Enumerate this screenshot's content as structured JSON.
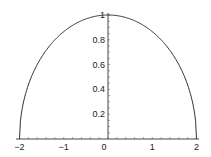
{
  "chart_data": {
    "type": "line",
    "title": "",
    "xlabel": "",
    "ylabel": "",
    "xlim": [
      -2,
      2
    ],
    "ylim": [
      0,
      1
    ],
    "x_ticks": [
      -2,
      -1,
      0,
      1,
      2
    ],
    "x_tick_labels": [
      "−2",
      "−1",
      "0",
      "1",
      "2"
    ],
    "y_ticks": [
      0.2,
      0.4,
      0.6,
      0.8,
      1
    ],
    "y_tick_labels": [
      "0.2",
      "0.4",
      "0.6",
      "0.8",
      "1"
    ],
    "grid": false,
    "legend": null,
    "series": [
      {
        "name": "y = sqrt(1 - x^2/4)",
        "color": "#333333",
        "x": [
          -2,
          -1.9,
          -1.75,
          -1.5,
          -1.25,
          -1,
          -0.75,
          -0.5,
          -0.25,
          0,
          0.25,
          0.5,
          0.75,
          1,
          1.25,
          1.5,
          1.75,
          1.9,
          2
        ],
        "y": [
          0,
          0.312,
          0.484,
          0.661,
          0.781,
          0.866,
          0.927,
          0.968,
          0.992,
          1,
          0.992,
          0.968,
          0.927,
          0.866,
          0.781,
          0.661,
          0.484,
          0.312,
          0
        ]
      }
    ]
  }
}
